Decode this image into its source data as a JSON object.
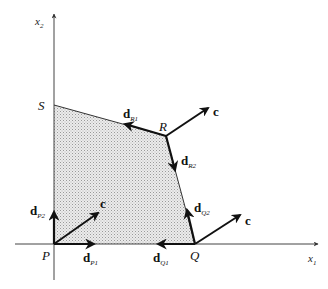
{
  "diagram": {
    "type": "feasible-region-with-direction-vectors",
    "axes": {
      "x_label": "x",
      "x_sub": "1",
      "y_label": "x",
      "y_sub": "2"
    },
    "vertices": [
      {
        "name": "P",
        "label": "P"
      },
      {
        "name": "Q",
        "label": "Q"
      },
      {
        "name": "R",
        "label": "R"
      },
      {
        "name": "S",
        "label": "S"
      }
    ],
    "vectors": {
      "c": "c",
      "d": "d",
      "dP1_sub": "P1",
      "dP2_sub": "P2",
      "dQ1_sub": "Q1",
      "dQ2_sub": "Q2",
      "dR1_sub": "R1",
      "dR2_sub": "R2"
    },
    "colors": {
      "region_fill": "#d9d9d9",
      "line": "#111111",
      "axis": "#555555"
    }
  }
}
